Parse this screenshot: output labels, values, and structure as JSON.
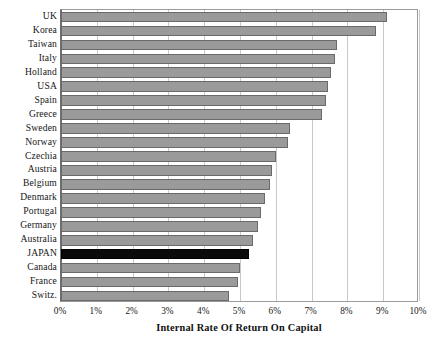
{
  "chart_data": {
    "type": "bar",
    "orientation": "horizontal",
    "title": "",
    "xlabel": "Internal Rate Of Return On Capital",
    "ylabel": "",
    "xlim": [
      0,
      10
    ],
    "xunit": "%",
    "xticks": [
      "0%",
      "1%",
      "2%",
      "3%",
      "4%",
      "5%",
      "6%",
      "7%",
      "8%",
      "9%",
      "10%"
    ],
    "xtick_values": [
      0,
      1,
      2,
      3,
      4,
      5,
      6,
      7,
      8,
      9,
      10
    ],
    "grid": true,
    "legend": "none",
    "categories": [
      "UK",
      "Korea",
      "Taiwan",
      "Italy",
      "Holland",
      "USA",
      "Spain",
      "Greece",
      "Sweden",
      "Norway",
      "Czechia",
      "Austria",
      "Belgium",
      "Denmark",
      "Portugal",
      "Germany",
      "Australia",
      "JAPAN",
      "Canada",
      "France",
      "Switz."
    ],
    "values": [
      9.1,
      8.8,
      7.7,
      7.65,
      7.55,
      7.45,
      7.4,
      7.3,
      6.4,
      6.35,
      6.0,
      5.9,
      5.85,
      5.7,
      5.6,
      5.5,
      5.35,
      5.25,
      5.0,
      4.95,
      4.7
    ],
    "bars": [
      {
        "category": "UK",
        "value": 9.1,
        "color": "#9a9a9a",
        "highlight": false
      },
      {
        "category": "Korea",
        "value": 8.8,
        "color": "#9a9a9a",
        "highlight": false
      },
      {
        "category": "Taiwan",
        "value": 7.7,
        "color": "#9a9a9a",
        "highlight": false
      },
      {
        "category": "Italy",
        "value": 7.65,
        "color": "#9a9a9a",
        "highlight": false
      },
      {
        "category": "Holland",
        "value": 7.55,
        "color": "#9a9a9a",
        "highlight": false
      },
      {
        "category": "USA",
        "value": 7.45,
        "color": "#9a9a9a",
        "highlight": false
      },
      {
        "category": "Spain",
        "value": 7.4,
        "color": "#9a9a9a",
        "highlight": false
      },
      {
        "category": "Greece",
        "value": 7.3,
        "color": "#9a9a9a",
        "highlight": false
      },
      {
        "category": "Sweden",
        "value": 6.4,
        "color": "#9a9a9a",
        "highlight": false
      },
      {
        "category": "Norway",
        "value": 6.35,
        "color": "#9a9a9a",
        "highlight": false
      },
      {
        "category": "Czechia",
        "value": 6.0,
        "color": "#9a9a9a",
        "highlight": false
      },
      {
        "category": "Austria",
        "value": 5.9,
        "color": "#9a9a9a",
        "highlight": false
      },
      {
        "category": "Belgium",
        "value": 5.85,
        "color": "#9a9a9a",
        "highlight": false
      },
      {
        "category": "Denmark",
        "value": 5.7,
        "color": "#9a9a9a",
        "highlight": false
      },
      {
        "category": "Portugal",
        "value": 5.6,
        "color": "#9a9a9a",
        "highlight": false
      },
      {
        "category": "Germany",
        "value": 5.5,
        "color": "#9a9a9a",
        "highlight": false
      },
      {
        "category": "Australia",
        "value": 5.35,
        "color": "#9a9a9a",
        "highlight": false
      },
      {
        "category": "JAPAN",
        "value": 5.25,
        "color": "#0a0a0a",
        "highlight": true
      },
      {
        "category": "Canada",
        "value": 5.0,
        "color": "#9a9a9a",
        "highlight": false
      },
      {
        "category": "France",
        "value": 4.95,
        "color": "#9a9a9a",
        "highlight": false
      },
      {
        "category": "Switz.",
        "value": 4.7,
        "color": "#9a9a9a",
        "highlight": false
      }
    ],
    "colors": {
      "bar_fill": "#9a9a9a",
      "bar_edge": "#6a6a6a",
      "highlight_fill": "#0a0a0a",
      "gridline": "#c9c9c9",
      "axis": "#6f6f6f",
      "text": "#161616",
      "background": "#ffffff"
    }
  }
}
